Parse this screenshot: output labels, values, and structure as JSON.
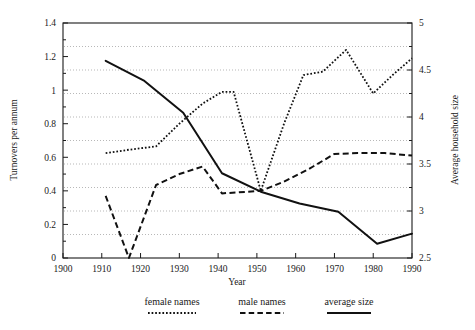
{
  "chart_data": {
    "type": "line",
    "title": "",
    "xlabel": "Year",
    "ylabel": "Turnovers per annum",
    "y2label": "Average household size",
    "xlim": [
      1900,
      1990
    ],
    "ylim": [
      0,
      1.4
    ],
    "y2lim": [
      2.5,
      5
    ],
    "xticks": [
      1900,
      1910,
      1920,
      1930,
      1940,
      1950,
      1960,
      1970,
      1980,
      1990
    ],
    "xtick_labels": [
      "1900",
      "1910",
      "1920",
      "1930",
      "1940",
      "1950",
      "1960",
      "1970",
      "1980",
      "1990"
    ],
    "yticks": [
      0,
      0.2,
      0.4,
      0.6,
      0.8,
      1,
      1.2,
      1.4
    ],
    "ytick_labels": [
      "0",
      "0.2",
      "0.4",
      "0.6",
      "0.8",
      "1",
      "1.2",
      "1.4"
    ],
    "y2ticks": [
      2.5,
      3,
      3.5,
      4,
      4.5,
      5
    ],
    "y2tick_labels": [
      "2.5",
      "3",
      "3.5",
      "4",
      "4.5",
      "5"
    ],
    "grid": true,
    "grid_axis": "y2",
    "grid_values": [
      2.75,
      3.0,
      3.25,
      3.5,
      3.75,
      4.0,
      4.25,
      4.5,
      4.75
    ],
    "legend_position": "below",
    "series": [
      {
        "name": "female names",
        "style": "dotted",
        "axis": "left",
        "x": [
          1911,
          1917,
          1924,
          1930,
          1936,
          1941,
          1944,
          1951,
          1957,
          1962,
          1967,
          1973,
          1980,
          1985,
          1990
        ],
        "values": [
          0.625,
          0.645,
          0.665,
          0.8,
          0.92,
          0.99,
          0.99,
          0.4,
          0.8,
          1.09,
          1.11,
          1.24,
          0.98,
          1.09,
          1.19
        ]
      },
      {
        "name": "male names",
        "style": "dashed",
        "axis": "left",
        "x": [
          1911,
          1917,
          1924,
          1930,
          1936,
          1941,
          1951,
          1957,
          1963,
          1970,
          1976,
          1983,
          1990
        ],
        "values": [
          0.37,
          0.0,
          0.435,
          0.5,
          0.545,
          0.385,
          0.4,
          0.455,
          0.525,
          0.62,
          0.625,
          0.625,
          0.61
        ]
      },
      {
        "name": "average size",
        "style": "solid",
        "axis": "left",
        "x": [
          1911,
          1921,
          1931,
          1941,
          1951,
          1961,
          1971,
          1981,
          1990
        ],
        "values": [
          1.175,
          1.055,
          0.865,
          0.505,
          0.395,
          0.325,
          0.275,
          0.085,
          0.145
        ]
      }
    ],
    "average_size_right_axis_values": [
      4.6,
      4.38,
      4.04,
      3.4,
      3.21,
      3.08,
      2.99,
      2.65,
      2.76
    ]
  },
  "legend": {
    "items": [
      {
        "label": "female names",
        "style": "dotted"
      },
      {
        "label": "male names",
        "style": "dashed"
      },
      {
        "label": "average size",
        "style": "solid"
      }
    ]
  }
}
